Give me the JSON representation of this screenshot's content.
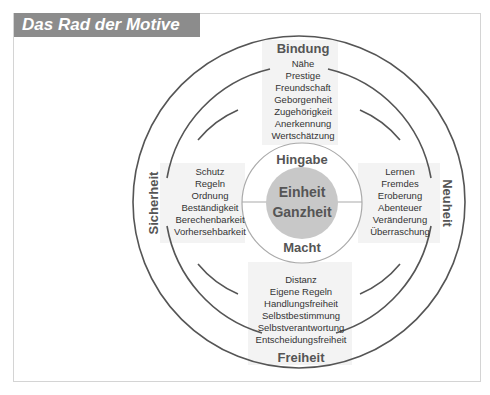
{
  "title": "Das Rad der Motive",
  "colors": {
    "title_bar": "#8c8c8c",
    "ring_line": "#555555",
    "shade": "#f0f0f0",
    "core_disc": "#c8c8c8",
    "text": "#333333",
    "heading": "#555555"
  },
  "quadrants": {
    "top": {
      "heading": "Bindung",
      "items": [
        "Nähe",
        "Prestige",
        "Freundschaft",
        "Geborgenheit",
        "Zugehörigkeit",
        "Anerkennung",
        "Wertschätzung"
      ]
    },
    "left": {
      "heading": "Sicherheit",
      "items": [
        "Schutz",
        "Regeln",
        "Ordnung",
        "Beständigkeit",
        "Berechenbarkeit",
        "Vorhersehbarkeit"
      ]
    },
    "right": {
      "heading": "Neuheit",
      "items": [
        "Lernen",
        "Fremdes",
        "Eroberung",
        "Abenteuer",
        "Veränderung",
        "Überraschung"
      ]
    },
    "bottom": {
      "heading": "Freiheit",
      "items": [
        "Distanz",
        "Eigene Regeln",
        "Handlungsfreiheit",
        "Selbstbestimmung",
        "Selbstverantwortung",
        "Entscheidungsfreiheit"
      ]
    }
  },
  "inner": {
    "upper": "Hingabe",
    "lower": "Macht",
    "core_line1": "Einheit",
    "core_line2": "Ganzheit"
  }
}
